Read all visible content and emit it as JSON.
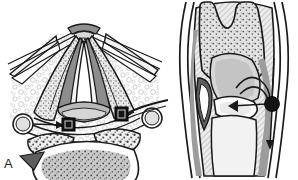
{
  "figure": {
    "type": "medical-anatomical-illustration",
    "subject": "larynx",
    "width": 298,
    "height": 180,
    "background_color": "#ffffff",
    "line_color": "#1a1a1a",
    "panel_count": 2
  },
  "panels": [
    {
      "id": "A",
      "label": "A",
      "view": "endoscopic superior laryngoscopic view",
      "description": "Transoral endoscopic view of the larynx showing epiglottis, vocal folds, aryepiglottic folds and tongue base with two dark square injection-site markers and a curved needle approaching from the right",
      "markers": [
        {
          "name": "injection-site-left",
          "shape": "square",
          "fill": "#141414",
          "cx": 68,
          "cy": 124
        },
        {
          "name": "injection-site-right",
          "shape": "square",
          "fill": "#141414",
          "cx": 121,
          "cy": 114
        }
      ],
      "structures": [
        "epiglottis",
        "vocal-fold-left",
        "vocal-fold-right",
        "aryepiglottic-fold-left",
        "aryepiglottic-fold-right",
        "false-vocal-fold",
        "arytenoid-region",
        "pyriform-sinus-left",
        "pyriform-sinus-right",
        "tongue-base-lingual-tonsil",
        "valleculae"
      ],
      "instruments": [
        "curved-injection-needle-right",
        "guide-cannula-left"
      ]
    },
    {
      "id": "B",
      "label": "B",
      "view": "coronal sectional view",
      "description": "Coronal section through the larynx and trachea showing epiglottis, ventricle, vocal fold, subglottis and a solid black circular marker on the right lateral wall with converging arrow lines",
      "markers": [
        {
          "name": "injection-site-marker",
          "shape": "circle",
          "fill": "#141414",
          "cx": 102,
          "cy": 104,
          "r": 7
        }
      ],
      "structures": [
        "epiglottis",
        "pre-epiglottic-space",
        "ventricle",
        "vocal-fold",
        "subglottic-airway",
        "thyroid-cartilage",
        "cricoid-cartilage",
        "trachea-wall-left",
        "trachea-wall-right"
      ],
      "instruments": [
        "needle-track-vertical",
        "needle-arrow-horizontal"
      ]
    }
  ],
  "palette": {
    "outline": "#1a1a1a",
    "stipple_gray": "#9a9a9a",
    "mid_gray": "#7d7d7d",
    "light_gray": "#cfcfcf",
    "pale_gray": "#e6e6e6",
    "hatch_gray": "#b5b5b5",
    "marker_black": "#141414",
    "white": "#ffffff"
  }
}
